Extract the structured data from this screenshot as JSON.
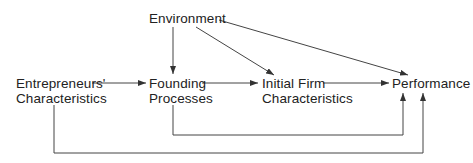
{
  "nodes": {
    "environment": {
      "label": "Environment"
    },
    "entrepreneurs": {
      "line1": "Entrepreneurs'",
      "line2": "Characteristics"
    },
    "founding": {
      "line1": "Founding",
      "line2": "Processes"
    },
    "initial_firm": {
      "line1": "Initial Firm",
      "line2": "Characteristics"
    },
    "performance": {
      "label": "Performance"
    }
  },
  "edges": [
    {
      "from": "Environment",
      "to": "Founding Processes"
    },
    {
      "from": "Environment",
      "to": "Initial Firm Characteristics"
    },
    {
      "from": "Environment",
      "to": "Performance"
    },
    {
      "from": "Entrepreneurs' Characteristics",
      "to": "Founding Processes"
    },
    {
      "from": "Founding Processes",
      "to": "Initial Firm Characteristics"
    },
    {
      "from": "Initial Firm Characteristics",
      "to": "Performance"
    },
    {
      "from": "Founding Processes",
      "to": "Performance"
    },
    {
      "from": "Entrepreneurs' Characteristics",
      "to": "Performance"
    }
  ],
  "colors": {
    "line": "#333333",
    "text": "#222222",
    "background": "#ffffff"
  }
}
